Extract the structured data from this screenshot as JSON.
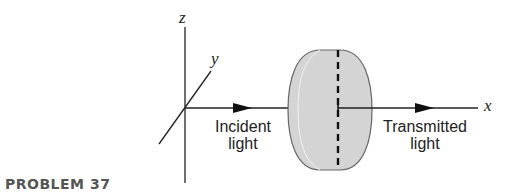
{
  "figure": {
    "problem_label": "PROBLEM 37",
    "axes": {
      "x": "x",
      "y": "y",
      "z": "z"
    },
    "labels": {
      "incident": "Incident\nlight",
      "incident_line1": "Incident",
      "incident_line2": "light",
      "transmitted_line1": "Transmitted",
      "transmitted_line2": "light"
    },
    "colors": {
      "lens_fill": "#d4d4d4",
      "stroke": "#222222",
      "label": "#555555"
    }
  }
}
